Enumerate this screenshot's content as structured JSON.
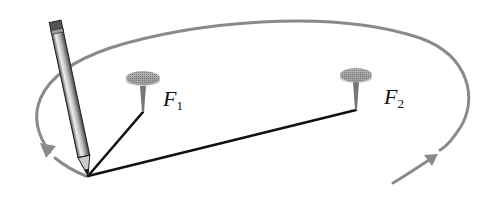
{
  "diagram": {
    "type": "ellipse-string-construction",
    "foci": [
      {
        "id": "F1",
        "letter": "F",
        "subscript": "1",
        "x": 143,
        "y": 112
      },
      {
        "id": "F2",
        "letter": "F",
        "subscript": "2",
        "x": 356,
        "y": 110
      }
    ],
    "pencil_point": {
      "x": 88,
      "y": 176
    },
    "colors": {
      "curve": "#8a8a8a",
      "string": "#111111",
      "pin": "#9a9a9a"
    }
  }
}
